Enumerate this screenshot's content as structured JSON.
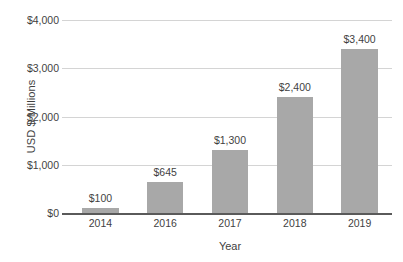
{
  "chart_data": {
    "type": "bar",
    "title": "",
    "subtitle": "",
    "xlabel": "Year",
    "ylabel": "USD $ Millions",
    "categories": [
      "2014",
      "2016",
      "2017",
      "2018",
      "2019"
    ],
    "values": [
      100,
      645,
      1300,
      2400,
      3400
    ],
    "data_labels": [
      "$100",
      "$645",
      "$1,300",
      "$2,400",
      "$3,400"
    ],
    "ylim": [
      0,
      4000
    ],
    "ytick_values": [
      0,
      1000,
      2000,
      3000,
      4000
    ],
    "ytick_labels": [
      "$0",
      "$1,000",
      "$2,000",
      "$3,000",
      "$4,000"
    ],
    "grid": true,
    "grid_axis": "y",
    "legend": false,
    "legend_position": "none",
    "series": [
      {
        "name": "USD $ Millions",
        "values": [
          100,
          645,
          1300,
          2400,
          3400
        ],
        "color": "#a8a8a8"
      }
    ],
    "colors": {
      "bar": "#a8a8a8",
      "gridline": "#d4d4d4",
      "axis": "#5a5a5a",
      "text": "#3f3f3f",
      "background": "#ffffff"
    }
  }
}
